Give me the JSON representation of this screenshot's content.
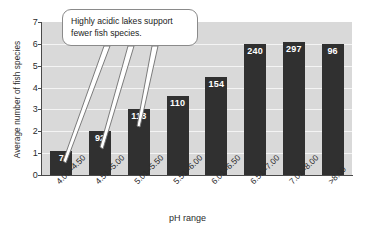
{
  "chart_data": {
    "type": "bar",
    "title": "",
    "xlabel": "pH range",
    "ylabel": "Average number of fish species",
    "categories": [
      "4.00–4.50",
      "4.51–5.00",
      "5.01–5.50",
      "5.51–6.00",
      "6.01–6.50",
      "6.51–7.00",
      "7.01–8.00",
      ">8.00"
    ],
    "values": [
      1.1,
      2.0,
      3.0,
      3.6,
      4.5,
      6.0,
      6.1,
      6.0
    ],
    "bar_labels": [
      "7",
      "92",
      "118",
      "110",
      "154",
      "240",
      "297",
      "96"
    ],
    "bar_label_meaning": "number of lakes sampled",
    "ylim": [
      0,
      7
    ],
    "yticks": [
      "0",
      "1",
      "2",
      "3",
      "4",
      "5",
      "6",
      "7"
    ],
    "grid": true,
    "legend": "none",
    "annotations": [
      {
        "text": "Highly acidic lakes support fewer fish species.",
        "points_to": [
          "4.00–4.50",
          "4.51–5.00",
          "5.01–5.50"
        ]
      }
    ],
    "colors": {
      "bar": "#303030",
      "plot_background": "#d9d9d9",
      "gridline": "#f4f4f4",
      "axis": "#4a4a4a",
      "value_label": "#ffffff",
      "callout_border": "#8a8a8a",
      "callout_background": "#ffffff"
    }
  },
  "callout": {
    "line1": "Highly acidic lakes support",
    "line2": "fewer fish species."
  }
}
